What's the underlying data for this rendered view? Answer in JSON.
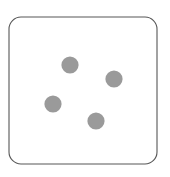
{
  "figure": {
    "name": "die-face",
    "caption": "",
    "canvas": {
      "width": 170,
      "height": 177,
      "background_color": "#ffffff"
    }
  },
  "die": {
    "label": "die-outline",
    "shape": "rounded-square",
    "x": 9,
    "y": 17,
    "width": 148,
    "height": 147,
    "corner_radius": 12,
    "fill_color": "#ffffff",
    "border_color": "#575757",
    "border_width": 1.1
  },
  "pips": {
    "count": 4,
    "value_label": "4",
    "color": "#9a9a9a",
    "radius": 8.6,
    "arrangement": "scattered",
    "items": [
      {
        "id": "pip-1",
        "label": "pip-top-left",
        "cx": 70,
        "cy": 65,
        "r": 8.6,
        "color": "#9a9a9a"
      },
      {
        "id": "pip-2",
        "label": "pip-top-right",
        "cx": 114,
        "cy": 79,
        "r": 8.6,
        "color": "#9a9a9a"
      },
      {
        "id": "pip-3",
        "label": "pip-bottom-left",
        "cx": 53,
        "cy": 104,
        "r": 8.6,
        "color": "#9a9a9a"
      },
      {
        "id": "pip-4",
        "label": "pip-bottom-right",
        "cx": 96,
        "cy": 121,
        "r": 8.6,
        "color": "#9a9a9a"
      }
    ]
  }
}
